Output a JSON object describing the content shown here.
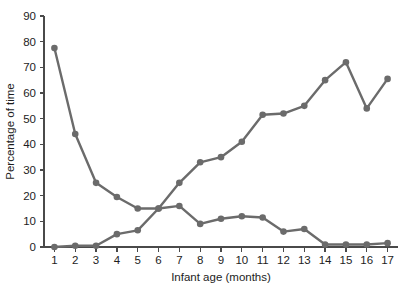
{
  "chart_data": {
    "type": "line",
    "title": "",
    "xlabel": "Infant age (months)",
    "ylabel": "Percentage of time",
    "x": [
      1,
      2,
      3,
      4,
      5,
      6,
      7,
      8,
      9,
      10,
      11,
      12,
      13,
      14,
      15,
      16,
      17
    ],
    "xlim": [
      0.5,
      17.5
    ],
    "ylim": [
      0,
      90
    ],
    "ytick_labels": [
      "0",
      "10",
      "20",
      "30",
      "40",
      "50",
      "60",
      "70",
      "80",
      "90"
    ],
    "yticks": [
      0,
      10,
      20,
      30,
      40,
      50,
      60,
      70,
      80,
      90
    ],
    "xtick_labels": [
      "1",
      "2",
      "3",
      "4",
      "5",
      "6",
      "7",
      "8",
      "9",
      "10",
      "11",
      "12",
      "13",
      "14",
      "15",
      "16",
      "17"
    ],
    "grid": false,
    "legend": "none",
    "marker": "circle",
    "series": [
      {
        "name": "decreasing-series",
        "color": "#6b6b6b",
        "values": [
          77.5,
          44,
          25,
          19.5,
          15,
          15,
          16,
          9,
          11,
          12,
          11.5,
          6,
          7,
          1,
          1,
          1,
          1.5
        ]
      },
      {
        "name": "increasing-series",
        "color": "#6b6b6b",
        "values": [
          0,
          0.5,
          0.5,
          5,
          6.5,
          15,
          25,
          33,
          35,
          41,
          51.5,
          52,
          55,
          65,
          72,
          54,
          65.5
        ]
      }
    ]
  },
  "style": {
    "line_color": "#6b6b6b",
    "axis_color": "#4a4a4a",
    "text_color": "#1d1d1d",
    "background": "#ffffff"
  }
}
